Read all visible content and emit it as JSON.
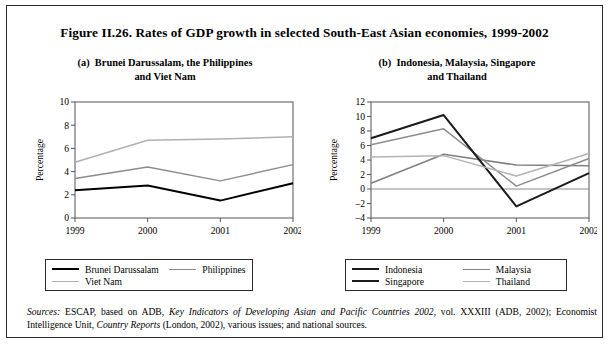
{
  "figure": {
    "title": "Figure II.26.  Rates of GDP growth in selected South-East Asian economies, 1999-2002",
    "panel_a_title": "(a)  Brunei Darussalam, the Philippines and Viet Nam",
    "panel_b_title": "(b)  Indonesia, Malaysia, Singapore and Thailand"
  },
  "sources": {
    "label": "Sources:",
    "text_1": "  ESCAP, based on ADB, ",
    "italic_1": "Key Indicators of Developing Asian and Pacific Countries 2002",
    "text_2": ", vol. XXXIII (ADB, 2002); Economist Intelligence Unit, ",
    "italic_2": "Country Reports",
    "text_3": " (London, 2002), various issues; and national sources."
  },
  "colors": {
    "brunei": "#000000",
    "philippines": "#8c8c8c",
    "vietnam": "#b0b0b0",
    "indonesia": "#1a1a1a",
    "malaysia": "#808080",
    "singapore": "#1a1a1a",
    "thailand": "#b3b3b3",
    "axis": "#555555",
    "frame": "#2a2a2a"
  },
  "legend_a": {
    "items": [
      {
        "label": "Brunei Darussalam",
        "color": "#000000",
        "width": "2.4"
      },
      {
        "label": "Philippines",
        "color": "#8c8c8c",
        "width": "1.8"
      },
      {
        "label": "Viet Nam",
        "color": "#b0b0b0",
        "width": "1.8"
      }
    ]
  },
  "legend_b": {
    "items": [
      {
        "label": "Indonesia",
        "color": "#1a1a1a",
        "width": "2.2"
      },
      {
        "label": "Malaysia",
        "color": "#808080",
        "width": "1.8"
      },
      {
        "label": "Singapore",
        "color": "#1a1a1a",
        "width": "2.2"
      },
      {
        "label": "Thailand",
        "color": "#b3b3b3",
        "width": "1.8"
      }
    ]
  },
  "chart_data": [
    {
      "type": "line",
      "title": "(a)  Brunei Darussalam, the Philippines and Viet Nam",
      "xlabel": "",
      "ylabel": "Percentage",
      "categories": [
        "1999",
        "2000",
        "2001",
        "2002"
      ],
      "ylim": [
        0,
        10
      ],
      "yticks": [
        0,
        2,
        4,
        6,
        8,
        10
      ],
      "grid": false,
      "legend_position": "below",
      "series": [
        {
          "name": "Brunei Darussalam",
          "color": "#000000",
          "values": [
            2.4,
            2.8,
            1.5,
            3.0
          ]
        },
        {
          "name": "Philippines",
          "color": "#8c8c8c",
          "values": [
            3.4,
            4.4,
            3.2,
            4.6
          ]
        },
        {
          "name": "Viet Nam",
          "color": "#b0b0b0",
          "values": [
            4.8,
            6.7,
            6.8,
            7.0
          ]
        }
      ]
    },
    {
      "type": "line",
      "title": "(b)  Indonesia, Malaysia, Singapore and Thailand",
      "xlabel": "",
      "ylabel": "Percentage",
      "categories": [
        "1999",
        "2000",
        "2001",
        "2002"
      ],
      "ylim": [
        -4,
        12
      ],
      "yticks": [
        -4,
        -2,
        0,
        2,
        4,
        6,
        8,
        10,
        12
      ],
      "grid": false,
      "legend_position": "below",
      "series": [
        {
          "name": "Indonesia",
          "color": "#808080",
          "values": [
            0.8,
            4.8,
            3.3,
            3.2
          ]
        },
        {
          "name": "Malaysia",
          "color": "#8c8c8c",
          "values": [
            6.1,
            8.3,
            0.4,
            4.2
          ]
        },
        {
          "name": "Singapore",
          "color": "#1a1a1a",
          "values": [
            7.0,
            10.2,
            -2.4,
            2.2
          ]
        },
        {
          "name": "Thailand",
          "color": "#b3b3b3",
          "values": [
            4.4,
            4.6,
            1.8,
            4.9
          ]
        }
      ]
    }
  ]
}
